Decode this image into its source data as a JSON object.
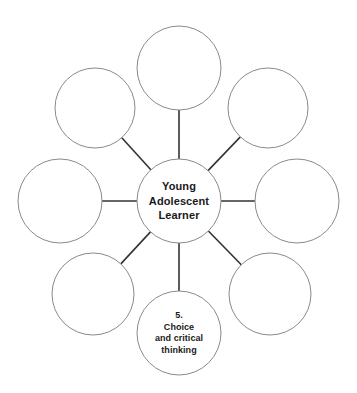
{
  "diagram": {
    "type": "radial-hub-and-spoke",
    "background_color": "#ffffff",
    "circle_stroke_color": "#8a8a8a",
    "spoke_stroke_color": "#333333",
    "text_color": "#1a1a1a",
    "center": {
      "name": "young-adolescent-learner",
      "lines": [
        "Young",
        "Adolescent",
        "Learner"
      ],
      "cx": 179,
      "cy": 201,
      "r": 42
    },
    "satellites": [
      {
        "name": "top",
        "lines": [],
        "cx": 179,
        "cy": 68,
        "r": 42,
        "angle_deg": 270
      },
      {
        "name": "top-right",
        "lines": [],
        "cx": 268,
        "cy": 108,
        "r": 40,
        "angle_deg": 315
      },
      {
        "name": "right",
        "lines": [],
        "cx": 297,
        "cy": 201,
        "r": 42,
        "angle_deg": 0
      },
      {
        "name": "bottom-right",
        "lines": [],
        "cx": 270,
        "cy": 294,
        "r": 41,
        "angle_deg": 45
      },
      {
        "name": "bottom-choice-and-critical-thinking",
        "lines": [
          "5.",
          "Choice",
          "and critical",
          "thinking"
        ],
        "cx": 179,
        "cy": 333,
        "r": 42,
        "angle_deg": 90
      },
      {
        "name": "bottom-left",
        "lines": [],
        "cx": 93,
        "cy": 294,
        "r": 41,
        "angle_deg": 135
      },
      {
        "name": "left",
        "lines": [],
        "cx": 60,
        "cy": 201,
        "r": 42,
        "angle_deg": 180
      },
      {
        "name": "top-left",
        "lines": [],
        "cx": 95,
        "cy": 108,
        "r": 40,
        "angle_deg": 225
      }
    ]
  }
}
